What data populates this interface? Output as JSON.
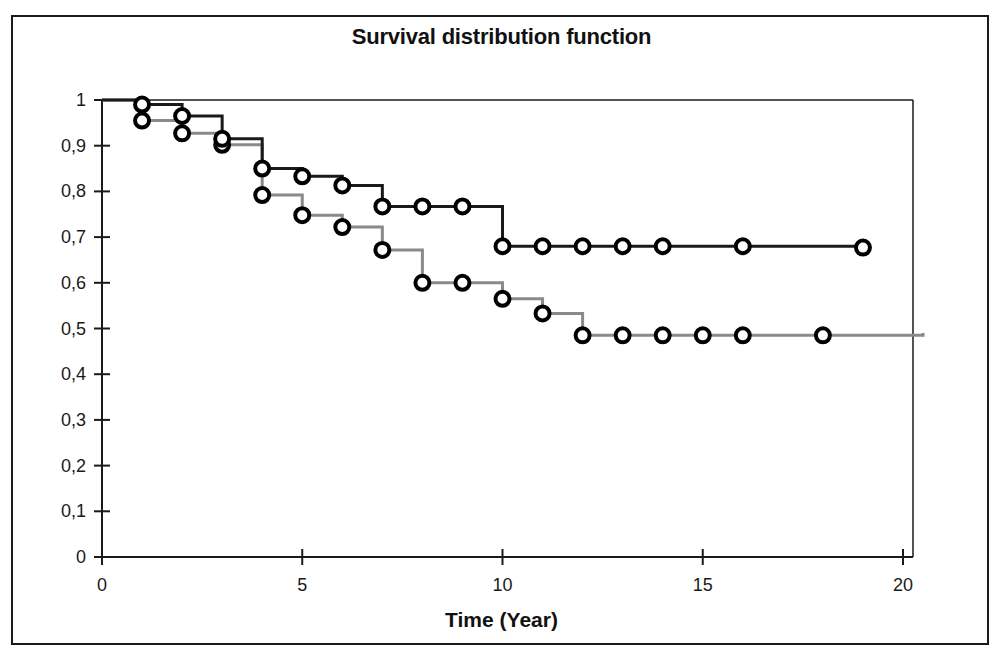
{
  "chart_data": {
    "type": "line",
    "title": "Survival distribution function",
    "subtitle": "",
    "xlabel": "Time (Year)",
    "ylabel": "",
    "xlim": [
      0,
      20
    ],
    "ylim": [
      0,
      1
    ],
    "xticks": [
      0,
      5,
      10,
      15,
      20
    ],
    "xticklabels": [
      "0",
      "5",
      "10",
      "15",
      "20"
    ],
    "yticks": [
      0,
      0.1,
      0.2,
      0.3,
      0.4,
      0.5,
      0.6,
      0.7,
      0.8,
      0.9,
      1
    ],
    "yticklabels": [
      "0",
      "0,1",
      "0,2",
      "0,3",
      "0,4",
      "0,5",
      "0,6",
      "0,7",
      "0,8",
      "0,9",
      "1"
    ],
    "grid": false,
    "legend": null,
    "decimal_separator": ",",
    "step_type": "post",
    "series": [
      {
        "name": "group-1",
        "color": "#1a1a1a",
        "marker": "open-circle",
        "marker_edge_color": "#000000",
        "marker_face_color": "#ffffff",
        "line_width": 3,
        "x": [
          0,
          1,
          2,
          3,
          4,
          5,
          6,
          7,
          8,
          9,
          10,
          11,
          12,
          13,
          14,
          15,
          16,
          18,
          19
        ],
        "y": [
          1.0,
          0.99,
          0.965,
          0.915,
          0.85,
          0.833,
          0.813,
          0.767,
          0.767,
          0.767,
          0.68,
          0.68,
          0.68,
          0.68,
          0.68,
          0.68,
          0.68,
          0.68,
          0.677
        ],
        "markers_x": [
          1,
          2,
          3,
          4,
          5,
          6,
          7,
          8,
          9,
          10,
          11,
          12,
          13,
          14,
          16,
          19
        ],
        "markers_y": [
          0.99,
          0.965,
          0.915,
          0.85,
          0.833,
          0.813,
          0.767,
          0.767,
          0.767,
          0.68,
          0.68,
          0.68,
          0.68,
          0.68,
          0.68,
          0.677
        ]
      },
      {
        "name": "group-2",
        "color": "#8a8a8a",
        "marker": "open-circle",
        "marker_edge_color": "#000000",
        "marker_face_color": "#ffffff",
        "line_width": 3,
        "x": [
          0,
          1,
          2,
          3,
          4,
          5,
          6,
          7,
          8,
          9,
          10,
          11,
          12,
          13,
          14,
          15,
          16,
          18,
          20.5
        ],
        "y": [
          1.0,
          0.955,
          0.927,
          0.902,
          0.792,
          0.748,
          0.722,
          0.672,
          0.6,
          0.6,
          0.565,
          0.533,
          0.485,
          0.485,
          0.485,
          0.485,
          0.485,
          0.485,
          0.49
        ],
        "markers_x": [
          1,
          2,
          3,
          4,
          5,
          6,
          7,
          8,
          9,
          10,
          11,
          12,
          13,
          14,
          15,
          16,
          18
        ],
        "markers_y": [
          0.955,
          0.927,
          0.902,
          0.792,
          0.748,
          0.722,
          0.672,
          0.6,
          0.6,
          0.565,
          0.533,
          0.485,
          0.485,
          0.485,
          0.485,
          0.485,
          0.485
        ]
      }
    ]
  }
}
